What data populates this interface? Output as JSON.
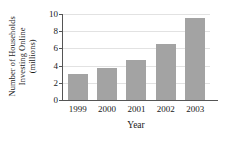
{
  "chart_data": {
    "type": "bar",
    "title": "",
    "xlabel": "Year",
    "ylabel": "Number of Households Investing Online (millions)",
    "ylabel_lines": [
      "Number of Households",
      "Investing Online",
      "(millions)"
    ],
    "categories": [
      "1999",
      "2000",
      "2001",
      "2002",
      "2003"
    ],
    "values": [
      3.0,
      3.7,
      4.7,
      6.5,
      9.5
    ],
    "ylim": [
      0,
      10
    ],
    "yticks": [
      0,
      2,
      4,
      6,
      8,
      10
    ],
    "ytick_labels": [
      "0",
      "2",
      "4",
      "6",
      "8",
      "10"
    ],
    "grid": true,
    "legend": false,
    "bar_color": "#a3a3a3",
    "axis_color": "#555555",
    "grid_color": "#e2e2e2",
    "background": "#ffffff"
  }
}
